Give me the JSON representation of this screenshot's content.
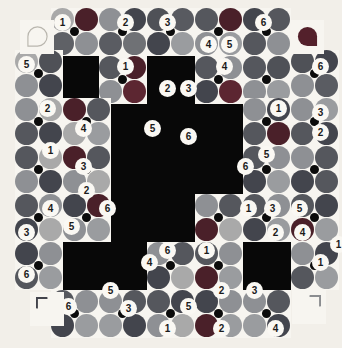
{
  "app": {
    "title": "Color Block Puzzle",
    "background_color": "#f2efe9",
    "board_color": "#080808",
    "tile_color": "#f7f5f0"
  },
  "palette": {
    "maroon": "#6d2230",
    "dark_slate": "#3a3f4a",
    "gray": "#8d8d8d",
    "light_gray": "#a8a8a8",
    "charcoal": "#2c2f36",
    "dim_gray": "#6a6c70",
    "deep_red": "#52202a",
    "mid_gray": "#777a7d"
  },
  "board": {
    "rows": 12,
    "cols": 12,
    "cell_size": 24,
    "origin_x": 27,
    "origin_y": 8
  },
  "corners": [
    {
      "name": "corner-tl",
      "shape": "teardrop-outline",
      "fill": "none",
      "stroke": "#b9b6ae"
    },
    {
      "name": "corner-tr",
      "shape": "teardrop-solid",
      "fill": "#53202b"
    },
    {
      "name": "corner-bl",
      "shape": "teardrop-solid",
      "fill": "#43444c"
    },
    {
      "name": "corner-br",
      "shape": "teardrop-solid",
      "fill": "#8b8d90"
    }
  ],
  "chart_data": {
    "type": "heatmap",
    "xlabel": "",
    "ylabel": "",
    "categories": [],
    "values": []
  },
  "tiles": [
    {
      "x": 51,
      "y": 8,
      "colors": [
        "#a9a9a9",
        "#4a2029",
        "#5f6166",
        "#8e9094"
      ]
    },
    {
      "x": 99,
      "y": 8,
      "colors": [
        "#8e9094",
        "#43454d",
        "#5a5c62",
        "#6f7175"
      ]
    },
    {
      "x": 147,
      "y": 8,
      "colors": [
        "#4f5157",
        "#585a60",
        "#43454d",
        "#9a9c9f"
      ]
    },
    {
      "x": 195,
      "y": 8,
      "colors": [
        "#55575d",
        "#4a2029",
        "#8e9094",
        "#9a9c9f"
      ]
    },
    {
      "x": 243,
      "y": 8,
      "colors": [
        "#43454d",
        "#55575d",
        "#55575d",
        "#8e9094"
      ]
    },
    {
      "x": 15,
      "y": 50,
      "colors": [
        "#a9a9a9",
        "#4f5157",
        "#8e9094",
        "#43454d"
      ]
    },
    {
      "x": 99,
      "y": 56,
      "colors": [
        "#55575d",
        "#4a2029",
        "#8e9094",
        "#5c2631"
      ]
    },
    {
      "x": 195,
      "y": 56,
      "colors": [
        "#55575d",
        "#8e9094",
        "#43454d",
        "#5c2631"
      ]
    },
    {
      "x": 243,
      "y": 56,
      "colors": [
        "#55575d",
        "#4f5157",
        "#8e9094",
        "#9a9c9f"
      ]
    },
    {
      "x": 291,
      "y": 50,
      "colors": [
        "#4f5157",
        "#43454d",
        "#8e9094",
        "#5a5c62"
      ]
    },
    {
      "x": 15,
      "y": 98,
      "colors": [
        "#8e9094",
        "#a9a9a9",
        "#55575d",
        "#43454d"
      ]
    },
    {
      "x": 63,
      "y": 98,
      "colors": [
        "#4a2029",
        "#55575d",
        "#a9a9a9",
        "#9a9c9f"
      ]
    },
    {
      "x": 243,
      "y": 98,
      "colors": [
        "#8e9094",
        "#43454d",
        "#55575d",
        "#4a2029"
      ]
    },
    {
      "x": 291,
      "y": 98,
      "colors": [
        "#8e9094",
        "#9a9c9f",
        "#55575d",
        "#43454d"
      ]
    },
    {
      "x": 15,
      "y": 146,
      "colors": [
        "#55575d",
        "#a9a9a9",
        "#8e9094",
        "#43454d"
      ]
    },
    {
      "x": 63,
      "y": 146,
      "colors": [
        "#4a2029",
        "#55575d",
        "#8e9094",
        "#a9a9a9"
      ]
    },
    {
      "x": 243,
      "y": 146,
      "colors": [
        "#55575d",
        "#8e9094",
        "#43454d",
        "#9a9c9f"
      ]
    },
    {
      "x": 291,
      "y": 146,
      "colors": [
        "#8e9094",
        "#55575d",
        "#43454d",
        "#55575d"
      ]
    },
    {
      "x": 15,
      "y": 194,
      "colors": [
        "#55575d",
        "#8e9094",
        "#43454d",
        "#a9a9a9"
      ]
    },
    {
      "x": 63,
      "y": 194,
      "colors": [
        "#43454d",
        "#4a2029",
        "#8e9094",
        "#9a9c9f"
      ]
    },
    {
      "x": 195,
      "y": 194,
      "colors": [
        "#8e9094",
        "#55575d",
        "#4a2029",
        "#a9a9a9"
      ]
    },
    {
      "x": 243,
      "y": 194,
      "colors": [
        "#55575d",
        "#8e9094",
        "#43454d",
        "#9a9c9f"
      ]
    },
    {
      "x": 291,
      "y": 194,
      "colors": [
        "#55575d",
        "#43454d",
        "#4a2029",
        "#9a9c9f"
      ]
    },
    {
      "x": 15,
      "y": 242,
      "colors": [
        "#43454d",
        "#8e9094",
        "#55575d",
        "#9a9c9f"
      ]
    },
    {
      "x": 147,
      "y": 242,
      "colors": [
        "#8e9094",
        "#55575d",
        "#43454d",
        "#a9a9a9"
      ]
    },
    {
      "x": 195,
      "y": 242,
      "colors": [
        "#55575d",
        "#8e9094",
        "#4a2029",
        "#9a9c9f"
      ]
    },
    {
      "x": 291,
      "y": 242,
      "colors": [
        "#8e9094",
        "#43454d",
        "#55575d",
        "#9a9c9f"
      ]
    },
    {
      "x": 51,
      "y": 290,
      "colors": [
        "#55575d",
        "#8e9094",
        "#43454d",
        "#9a9c9f"
      ]
    },
    {
      "x": 99,
      "y": 290,
      "colors": [
        "#8e9094",
        "#55575d",
        "#9a9c9f",
        "#43454d"
      ]
    },
    {
      "x": 147,
      "y": 290,
      "colors": [
        "#55575d",
        "#43454d",
        "#8e9094",
        "#a9a9a9"
      ]
    },
    {
      "x": 195,
      "y": 290,
      "colors": [
        "#43454d",
        "#8e9094",
        "#4a2029",
        "#9a9c9f"
      ]
    },
    {
      "x": 243,
      "y": 290,
      "colors": [
        "#8e9094",
        "#55575d",
        "#9a9c9f",
        "#43454d"
      ]
    }
  ],
  "badges": [
    {
      "value": "1",
      "x": 54,
      "y": 14
    },
    {
      "value": "2",
      "x": 117,
      "y": 14
    },
    {
      "value": "3",
      "x": 159,
      "y": 14
    },
    {
      "value": "6",
      "x": 255,
      "y": 14
    },
    {
      "value": "4",
      "x": 200,
      "y": 36
    },
    {
      "value": "5",
      "x": 221,
      "y": 36
    },
    {
      "value": "5",
      "x": 18,
      "y": 56
    },
    {
      "value": "1",
      "x": 117,
      "y": 58
    },
    {
      "value": "4",
      "x": 216,
      "y": 58
    },
    {
      "value": "6",
      "x": 312,
      "y": 58
    },
    {
      "value": "2",
      "x": 39,
      "y": 100
    },
    {
      "value": "2",
      "x": 159,
      "y": 80
    },
    {
      "value": "3",
      "x": 180,
      "y": 80
    },
    {
      "value": "3",
      "x": 312,
      "y": 104
    },
    {
      "value": "1",
      "x": 270,
      "y": 100
    },
    {
      "value": "4",
      "x": 75,
      "y": 120
    },
    {
      "value": "5",
      "x": 144,
      "y": 120
    },
    {
      "value": "6",
      "x": 180,
      "y": 128
    },
    {
      "value": "2",
      "x": 312,
      "y": 124
    },
    {
      "value": "1",
      "x": 42,
      "y": 142
    },
    {
      "value": "3",
      "x": 75,
      "y": 158
    },
    {
      "value": "6",
      "x": 237,
      "y": 158
    },
    {
      "value": "5",
      "x": 258,
      "y": 146
    },
    {
      "value": "2",
      "x": 78,
      "y": 182
    },
    {
      "value": "4",
      "x": 42,
      "y": 200
    },
    {
      "value": "5",
      "x": 63,
      "y": 218
    },
    {
      "value": "6",
      "x": 99,
      "y": 200
    },
    {
      "value": "1",
      "x": 240,
      "y": 200
    },
    {
      "value": "3",
      "x": 264,
      "y": 200
    },
    {
      "value": "5",
      "x": 291,
      "y": 200
    },
    {
      "value": "3",
      "x": 18,
      "y": 224
    },
    {
      "value": "1",
      "x": 330,
      "y": 236
    },
    {
      "value": "4",
      "x": 294,
      "y": 224
    },
    {
      "value": "6",
      "x": 159,
      "y": 242
    },
    {
      "value": "1",
      "x": 198,
      "y": 242
    },
    {
      "value": "2",
      "x": 267,
      "y": 224
    },
    {
      "value": "6",
      "x": 18,
      "y": 266
    },
    {
      "value": "4",
      "x": 141,
      "y": 254
    },
    {
      "value": "5",
      "x": 102,
      "y": 282
    },
    {
      "value": "3",
      "x": 120,
      "y": 300
    },
    {
      "value": "2",
      "x": 213,
      "y": 282
    },
    {
      "value": "3",
      "x": 246,
      "y": 282
    },
    {
      "value": "1",
      "x": 312,
      "y": 254
    },
    {
      "value": "6",
      "x": 60,
      "y": 298
    },
    {
      "value": "5",
      "x": 180,
      "y": 298
    },
    {
      "value": "1",
      "x": 159,
      "y": 320
    },
    {
      "value": "2",
      "x": 213,
      "y": 320
    },
    {
      "value": "4",
      "x": 267,
      "y": 320
    }
  ]
}
